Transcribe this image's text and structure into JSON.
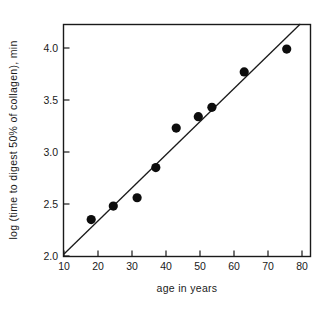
{
  "chart_data": {
    "type": "scatter",
    "title": "",
    "xlabel": "age in years",
    "ylabel": "log (time to digest 50% of collagen), min",
    "xlim": [
      10,
      82
    ],
    "ylim": [
      2.0,
      4.3
    ],
    "xticks": [
      10,
      20,
      30,
      40,
      50,
      60,
      70,
      80
    ],
    "xtick_labels": [
      "10",
      "20",
      "30",
      "40",
      "50",
      "60",
      "70",
      "80"
    ],
    "yticks": [
      2.0,
      2.5,
      3.0,
      3.5,
      4.0
    ],
    "ytick_labels": [
      "2.0",
      "2.5",
      "3.0",
      "3.5",
      "4.0"
    ],
    "grid": false,
    "legend": false,
    "marker_color": "#0d0d0d",
    "line_color": "#1a1a1a",
    "x": [
      18.0,
      24.5,
      31.5,
      37.0,
      43.0,
      49.5,
      53.5,
      63.0,
      75.5
    ],
    "y": [
      2.35,
      2.48,
      2.56,
      2.85,
      3.23,
      3.34,
      3.43,
      3.77,
      3.99
    ],
    "points": [
      {
        "x": 18.0,
        "y": 2.35
      },
      {
        "x": 24.5,
        "y": 2.48
      },
      {
        "x": 31.5,
        "y": 2.56
      },
      {
        "x": 37.0,
        "y": 2.85
      },
      {
        "x": 43.0,
        "y": 3.23
      },
      {
        "x": 49.5,
        "y": 3.34
      },
      {
        "x": 53.5,
        "y": 3.43
      },
      {
        "x": 63.0,
        "y": 3.77
      },
      {
        "x": 75.5,
        "y": 3.99
      }
    ],
    "fit_line": {
      "name": "regression-line",
      "x_start": 10.0,
      "y_start": 2.02,
      "x_end": 79.5,
      "y_end": 4.23
    }
  }
}
